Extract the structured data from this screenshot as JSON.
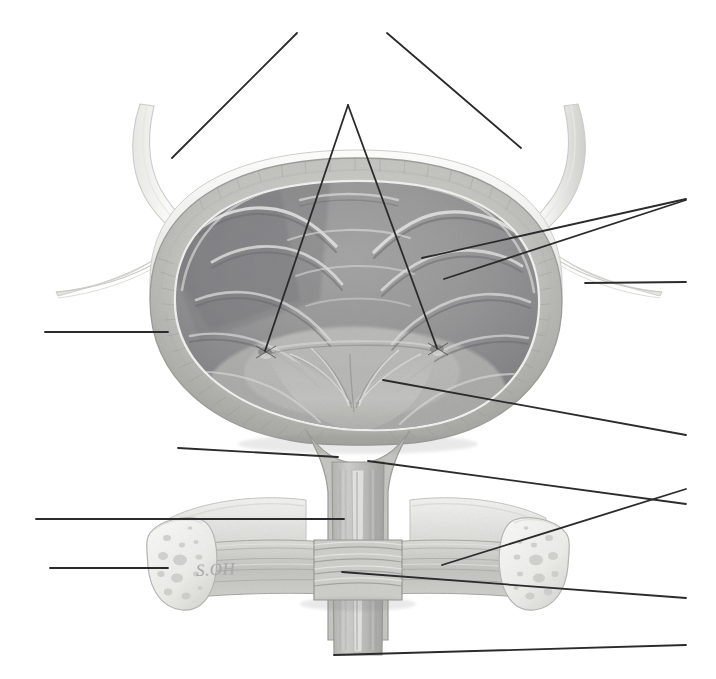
{
  "plate": {
    "title": "Urinary bladder, coronal section",
    "subject": "urinary-bladder",
    "view": "coronal-section-anterior",
    "style": "graphite-pencil-medical-illustration",
    "width": 716,
    "height": 679,
    "background_color": "#ffffff",
    "signature": "S.OH",
    "signature_color": "#a8a8a8",
    "labels_present": false,
    "leader_line_color": "#2b2b2b",
    "leader_line_width": 1.8
  },
  "palette": {
    "paper": "#ffffff",
    "serosa_light": "#f3f3f1",
    "serosa_edge": "#d8d8d5",
    "detrusor_mid": "#c9c9c6",
    "detrusor_dark": "#a9a9a6",
    "mucosa_light": "#b6b6b3",
    "mucosa_mid": "#9d9d9a",
    "mucosa_dark": "#8a8a88",
    "mucosa_deep": "#76767a",
    "trigone": "#b9b9b6",
    "bone_fill": "#efefed",
    "bone_edge": "#c6c6c2",
    "sphincter": "#cdcdc9",
    "ink": "#2b2b2b",
    "shadow": "#6e6e6e"
  },
  "structures": [
    {
      "name": "ureter-left",
      "region": "upper-left",
      "description": "left ureter descending to bladder"
    },
    {
      "name": "ureter-right",
      "region": "upper-right",
      "description": "right ureter descending to bladder"
    },
    {
      "name": "peritoneum-fold-left",
      "region": "mid-left",
      "description": "reflected peritoneal fold"
    },
    {
      "name": "peritoneum-fold-right",
      "region": "mid-right",
      "description": "reflected peritoneal fold"
    },
    {
      "name": "detrusor-muscle-wall",
      "region": "bladder-wall",
      "description": "muscular bladder wall"
    },
    {
      "name": "bladder-mucosa-rugae",
      "region": "bladder-interior",
      "description": "folded mucosal lining"
    },
    {
      "name": "ureteric-orifice-left",
      "region": "trigone",
      "description": "left ureteric orifice"
    },
    {
      "name": "ureteric-orifice-right",
      "region": "trigone",
      "description": "right ureteric orifice"
    },
    {
      "name": "trigone",
      "region": "bladder-floor",
      "description": "smooth trigonal area"
    },
    {
      "name": "bladder-neck",
      "region": "outlet",
      "description": "internal urethral orifice region"
    },
    {
      "name": "urethra",
      "region": "outlet",
      "description": "urethral canal"
    },
    {
      "name": "urethral-sphincter",
      "region": "outlet",
      "description": "banded sphincter muscle"
    },
    {
      "name": "pubic-bone-left",
      "region": "lower-left",
      "description": "cut pubic bone, spongy texture"
    },
    {
      "name": "pubic-bone-right",
      "region": "lower-right",
      "description": "cut pubic bone, spongy texture"
    },
    {
      "name": "pelvic-floor-muscle",
      "region": "lower",
      "description": "pelvic floor / perineal membrane"
    }
  ],
  "leader_lines": [
    {
      "id": "ll-01",
      "name": "leader-upper-left-diagonal",
      "x1": 297,
      "y1": 33,
      "x2": 172,
      "y2": 158,
      "points_to": "ureter-left",
      "label": ""
    },
    {
      "id": "ll-02",
      "name": "leader-upper-right-diagonal",
      "x1": 387,
      "y1": 33,
      "x2": 521,
      "y2": 148,
      "points_to": "ureter-right",
      "label": ""
    },
    {
      "id": "ll-03",
      "name": "leader-apex-to-left-orifice",
      "x1": 348,
      "y1": 105,
      "x2": 265,
      "y2": 351,
      "points_to": "ureteric-orifice-left",
      "label": ""
    },
    {
      "id": "ll-04",
      "name": "leader-apex-to-right-orifice",
      "x1": 348,
      "y1": 105,
      "x2": 437,
      "y2": 348,
      "points_to": "ureteric-orifice-right",
      "label": ""
    },
    {
      "id": "ll-05",
      "name": "leader-right-upper-mucosa",
      "x1": 686,
      "y1": 199,
      "x2": 422,
      "y2": 258,
      "points_to": "bladder-mucosa-rugae",
      "label": ""
    },
    {
      "id": "ll-06",
      "name": "leader-right-lower-mucosa",
      "x1": 686,
      "y1": 200,
      "x2": 444,
      "y2": 279,
      "points_to": "detrusor-muscle-wall",
      "label": ""
    },
    {
      "id": "ll-07",
      "name": "leader-right-peritoneum",
      "x1": 686,
      "y1": 282,
      "x2": 585,
      "y2": 283,
      "points_to": "peritoneum-fold-right",
      "label": ""
    },
    {
      "id": "ll-08",
      "name": "leader-left-bladder-wall",
      "x1": 45,
      "y1": 332,
      "x2": 168,
      "y2": 332,
      "points_to": "detrusor-muscle-wall",
      "label": ""
    },
    {
      "id": "ll-09",
      "name": "leader-right-trigone",
      "x1": 686,
      "y1": 435,
      "x2": 383,
      "y2": 380,
      "points_to": "trigone",
      "label": ""
    },
    {
      "id": "ll-10",
      "name": "leader-left-bladder-neck",
      "x1": 178,
      "y1": 448,
      "x2": 338,
      "y2": 457,
      "points_to": "bladder-neck",
      "label": ""
    },
    {
      "id": "ll-11",
      "name": "leader-right-bladder-neck",
      "x1": 686,
      "y1": 504,
      "x2": 368,
      "y2": 461,
      "points_to": "bladder-neck",
      "label": ""
    },
    {
      "id": "ll-12",
      "name": "leader-left-urethra",
      "x1": 36,
      "y1": 519,
      "x2": 344,
      "y2": 519,
      "points_to": "urethra",
      "label": ""
    },
    {
      "id": "ll-13",
      "name": "leader-left-pubic-bone",
      "x1": 50,
      "y1": 568,
      "x2": 168,
      "y2": 568,
      "points_to": "pubic-bone-left",
      "label": ""
    },
    {
      "id": "ll-14",
      "name": "leader-right-pelvic-floor",
      "x1": 686,
      "y1": 489,
      "x2": 442,
      "y2": 565,
      "points_to": "pelvic-floor-muscle",
      "label": ""
    },
    {
      "id": "ll-15",
      "name": "leader-right-sphincter",
      "x1": 686,
      "y1": 598,
      "x2": 342,
      "y2": 572,
      "points_to": "urethral-sphincter",
      "label": ""
    },
    {
      "id": "ll-16",
      "name": "leader-bottom-urethra",
      "x1": 686,
      "y1": 645,
      "x2": 334,
      "y2": 655,
      "points_to": "urethra",
      "label": ""
    }
  ]
}
